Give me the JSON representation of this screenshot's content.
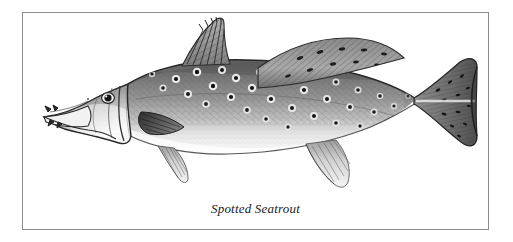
{
  "plate": {
    "background_color": "#ffffff",
    "border_color": "#8c8c8c",
    "caption": "Spotted Seatrout",
    "caption_style": "italic-serif"
  },
  "illustration": {
    "subject": "spotted-seatrout-fish",
    "orientation": "left-facing lateral view",
    "technique": "pen-and-ink stipple / line engraving, grayscale",
    "palette": {
      "body_dark": "#6f6f6f",
      "body_mid": "#9a9a9a",
      "body_light": "#d8d8d8",
      "belly": "#fbfbfb",
      "spot": "#1b1b1b",
      "spot_halo": "#f2f2f2",
      "outline": "#2a2a2a",
      "fin_dark": "#4a4a4a",
      "fin_light": "#cfcfcf"
    },
    "parts": [
      {
        "name": "head",
        "label": "Head"
      },
      {
        "name": "eye",
        "label": "Eye"
      },
      {
        "name": "mouth",
        "label": "Mouth with canine teeth"
      },
      {
        "name": "gill-cover",
        "label": "Operculum"
      },
      {
        "name": "first-dorsal-fin",
        "label": "First dorsal fin (spiny)"
      },
      {
        "name": "second-dorsal-fin",
        "label": "Second dorsal fin (soft, spotted)"
      },
      {
        "name": "pectoral-fin",
        "label": "Pectoral fin"
      },
      {
        "name": "pelvic-fin",
        "label": "Pelvic fin"
      },
      {
        "name": "anal-fin",
        "label": "Anal fin"
      },
      {
        "name": "caudal-fin",
        "label": "Caudal fin (tail)"
      },
      {
        "name": "lateral-line",
        "label": "Lateral line"
      },
      {
        "name": "body-spots",
        "label": "Round black spots"
      }
    ]
  }
}
